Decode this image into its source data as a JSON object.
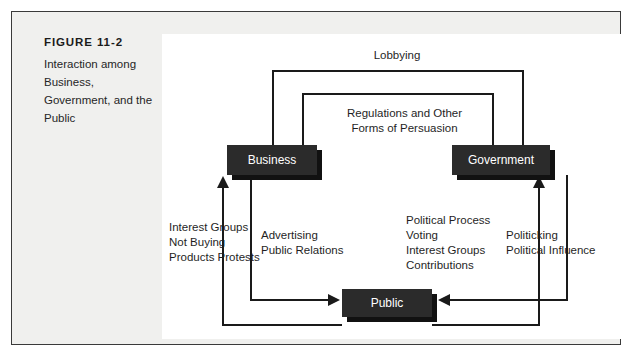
{
  "figure": {
    "number": "FIGURE 11-2",
    "caption": "Interaction among Business, Government, and the Public"
  },
  "diagram": {
    "type": "cycle-flow",
    "nodes": [
      {
        "id": "business",
        "label": "Business"
      },
      {
        "id": "government",
        "label": "Government"
      },
      {
        "id": "public",
        "label": "Public"
      }
    ],
    "flows": [
      {
        "id": "lobbying",
        "label": "Lobbying",
        "from": "business",
        "to": "government",
        "position": "top-outer"
      },
      {
        "id": "regulations",
        "label": "Regulations and Other\nForms of Persuasion",
        "from": "government",
        "to": "business",
        "position": "top-inner"
      },
      {
        "id": "public-to-business",
        "label": "Interest Groups\nNot Buying\nProducts Protests",
        "from": "public",
        "to": "business",
        "position": "left-outer"
      },
      {
        "id": "business-to-public",
        "label": "Advertising\nPublic Relations",
        "from": "business",
        "to": "public",
        "position": "left-inner"
      },
      {
        "id": "public-to-government",
        "label": "Political Process\nVoting\nInterest Groups\nContributions",
        "from": "public",
        "to": "government",
        "position": "right-inner"
      },
      {
        "id": "government-to-public",
        "label": "Politicking\nPolitical Influence",
        "from": "government",
        "to": "public",
        "position": "right-outer"
      }
    ]
  },
  "colors": {
    "node_fill": "#2b2b2b",
    "node_text": "#ffffff",
    "line": "#1a1a1a",
    "panel": "#ffffff",
    "frame_fill": "#f0f0ee",
    "frame_border": "#3a3a3a"
  }
}
